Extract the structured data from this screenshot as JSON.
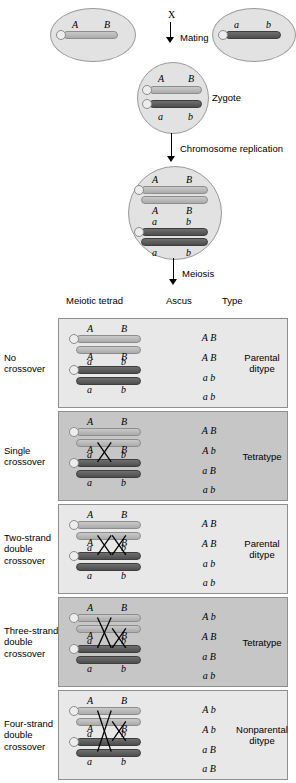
{
  "diagram": {
    "parents": {
      "left": {
        "name": "parent-cell-AB",
        "alleles": [
          "A",
          "B"
        ],
        "chromosome_shade": "light"
      },
      "right": {
        "name": "parent-cell-ab",
        "alleles": [
          "a",
          "b"
        ],
        "chromosome_shade": "dark"
      },
      "cross_symbol": "X",
      "mating_label": "Mating"
    },
    "zygote": {
      "label": "Zygote",
      "chromosomes": [
        {
          "alleles": [
            "A",
            "B"
          ],
          "shade": "light"
        },
        {
          "alleles": [
            "a",
            "b"
          ],
          "shade": "dark"
        }
      ]
    },
    "replication": {
      "label": "Chromosome replication",
      "chromatids": [
        {
          "alleles": [
            "A",
            "B"
          ],
          "shade": "light"
        },
        {
          "alleles": [
            "A",
            "B"
          ],
          "shade": "light"
        },
        {
          "alleles": [
            "a",
            "b"
          ],
          "shade": "dark"
        },
        {
          "alleles": [
            "a",
            "b"
          ],
          "shade": "dark"
        }
      ]
    },
    "meiosis": {
      "label": "Meiosis"
    },
    "columns": {
      "tetrad": "Meiotic tetrad",
      "ascus": "Ascus",
      "type": "Type"
    },
    "rows": [
      {
        "label": "No\ncrossover",
        "shading": "light",
        "chromatids": [
          {
            "alleles": [
              "A",
              "B"
            ],
            "shade": "light"
          },
          {
            "alleles": [
              "A",
              "B"
            ],
            "shade": "light"
          },
          {
            "alleles": [
              "a",
              "b"
            ],
            "shade": "dark"
          },
          {
            "alleles": [
              "a",
              "b"
            ],
            "shade": "dark"
          }
        ],
        "crossovers": [],
        "ascus": [
          "A B",
          "A B",
          "a b",
          "a b"
        ],
        "type": "Parental\nditype"
      },
      {
        "label": "Single\ncrossover",
        "shading": "dark",
        "chromatids": [
          {
            "alleles": [
              "A",
              "B"
            ],
            "shade": "light"
          },
          {
            "alleles": [
              "A",
              "B"
            ],
            "shade": "light"
          },
          {
            "alleles": [
              "a",
              "b"
            ],
            "shade": "dark"
          },
          {
            "alleles": [
              "a",
              "b"
            ],
            "shade": "dark"
          }
        ],
        "crossovers": [
          {
            "strands": [
              2,
              3
            ],
            "position": 1
          }
        ],
        "ascus": [
          "A B",
          "A b",
          "a B",
          "a b"
        ],
        "type": "Tetratype"
      },
      {
        "label": "Two-strand\ndouble\ncrossover",
        "shading": "light",
        "chromatids": [
          {
            "alleles": [
              "A",
              "B"
            ],
            "shade": "light"
          },
          {
            "alleles": [
              "A",
              "B"
            ],
            "shade": "light"
          },
          {
            "alleles": [
              "a",
              "b"
            ],
            "shade": "dark"
          },
          {
            "alleles": [
              "a",
              "b"
            ],
            "shade": "dark"
          }
        ],
        "crossovers": [
          {
            "strands": [
              2,
              3
            ],
            "position": 1
          },
          {
            "strands": [
              2,
              3
            ],
            "position": 2
          }
        ],
        "ascus": [
          "A B",
          "A B",
          "a b",
          "a b"
        ],
        "type": "Parental\nditype"
      },
      {
        "label": "Three-strand\ndouble\ncrossover",
        "shading": "dark",
        "chromatids": [
          {
            "alleles": [
              "A",
              "B"
            ],
            "shade": "light"
          },
          {
            "alleles": [
              "A",
              "B"
            ],
            "shade": "light"
          },
          {
            "alleles": [
              "a",
              "b"
            ],
            "shade": "dark"
          },
          {
            "alleles": [
              "a",
              "b"
            ],
            "shade": "dark"
          }
        ],
        "crossovers": [
          {
            "strands": [
              1,
              3
            ],
            "position": 1
          },
          {
            "strands": [
              2,
              3
            ],
            "position": 2
          }
        ],
        "ascus": [
          "A b",
          "A B",
          "a B",
          "a b"
        ],
        "type": "Tetratype"
      },
      {
        "label": "Four-strand\ndouble\ncrossover",
        "shading": "light",
        "chromatids": [
          {
            "alleles": [
              "A",
              "B"
            ],
            "shade": "light"
          },
          {
            "alleles": [
              "A",
              "B"
            ],
            "shade": "light"
          },
          {
            "alleles": [
              "a",
              "b"
            ],
            "shade": "dark"
          },
          {
            "alleles": [
              "a",
              "b"
            ],
            "shade": "dark"
          }
        ],
        "crossovers": [
          {
            "strands": [
              1,
              4
            ],
            "position": 1
          },
          {
            "strands": [
              2,
              3
            ],
            "position": 2
          }
        ],
        "ascus": [
          "A b",
          "A b",
          "a B",
          "a B"
        ],
        "type": "Nonparental\nditype"
      }
    ],
    "colors": {
      "panel_light": "#e8e8e8",
      "panel_dark": "#c6c6c6",
      "cell_fill": "#e2e2e2",
      "chromatid_light": "#bcbcbc",
      "chromatid_dark": "#5c5c5c",
      "outline": "#8f8f8f"
    }
  }
}
